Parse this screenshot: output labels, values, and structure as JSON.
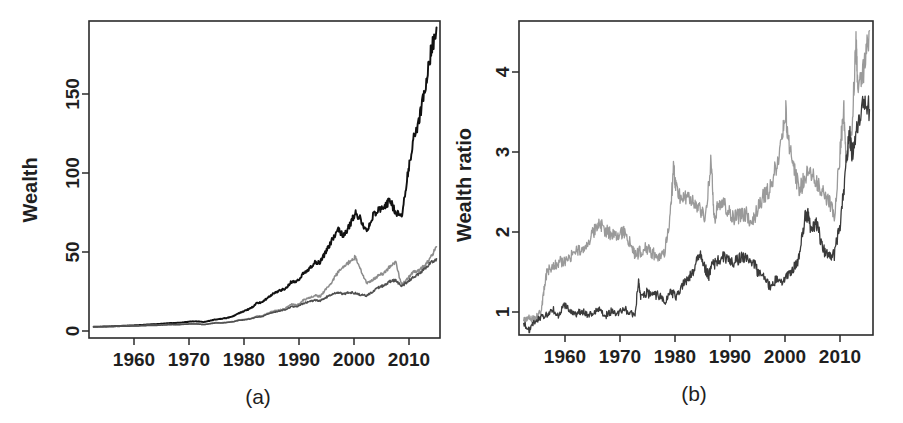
{
  "figure": {
    "background": "#ffffff",
    "panels": [
      {
        "id": "a",
        "caption": "(a)",
        "ylabel": "Wealth",
        "xlabel": "",
        "y_ticks": [
          0,
          50,
          100,
          150
        ],
        "x_ticks": [
          1960,
          1970,
          1980,
          1990,
          2000,
          2010
        ]
      },
      {
        "id": "b",
        "caption": "(b)",
        "ylabel": "Wealth ratio",
        "xlabel": "",
        "y_ticks": [
          1,
          2,
          3,
          4
        ],
        "x_ticks": [
          1960,
          1970,
          1980,
          1990,
          2000,
          2010
        ]
      }
    ]
  },
  "chart_data": [
    {
      "type": "line",
      "title": "",
      "caption": "(a)",
      "xlabel": "",
      "ylabel": "Wealth",
      "xlim": [
        1954.2,
        2014.6
      ],
      "ylim": [
        -6,
        192
      ],
      "xticks": [
        1960,
        1970,
        1980,
        1990,
        2000,
        2010
      ],
      "yticks": [
        0,
        50,
        100,
        150
      ],
      "grid": false,
      "legend": "none",
      "series": [
        {
          "name": "strategy-black",
          "color": "#111111",
          "width": 1.9,
          "x": [
            1955,
            1956,
            1957,
            1958,
            1959,
            1960,
            1961,
            1962,
            1963,
            1964,
            1965,
            1966,
            1967,
            1968,
            1969,
            1970,
            1971,
            1972,
            1973,
            1974,
            1975,
            1976,
            1977,
            1978,
            1979,
            1980,
            1981,
            1982,
            1983,
            1984,
            1985,
            1986,
            1987,
            1988,
            1989,
            1990,
            1991,
            1992,
            1993,
            1994,
            1995,
            1996,
            1997,
            1998,
            1999,
            2000,
            2001,
            2002,
            2003,
            2004,
            2005,
            2006,
            2007,
            2008,
            2009,
            2010,
            2011,
            2012,
            2013,
            2014
          ],
          "values": [
            1.0,
            1.1,
            1.2,
            1.3,
            1.5,
            1.6,
            1.8,
            1.9,
            2.1,
            2.4,
            2.6,
            2.7,
            3.0,
            3.3,
            3.4,
            3.6,
            4.0,
            4.4,
            4.3,
            4.0,
            4.8,
            5.6,
            6.0,
            6.6,
            7.6,
            9.5,
            11.0,
            12.5,
            15.5,
            16.5,
            19.0,
            22.0,
            23.5,
            25.0,
            29.0,
            29.5,
            34.0,
            37.0,
            41.0,
            41.5,
            48.0,
            55.0,
            62.0,
            58.0,
            64.0,
            72.0,
            68.0,
            60.0,
            70.0,
            74.0,
            76.0,
            80.0,
            72.0,
            70.0,
            95.0,
            118.0,
            130.0,
            150.0,
            172.0,
            188.0
          ]
        },
        {
          "name": "strategy-midgray",
          "color": "#8c8c8c",
          "width": 1.5,
          "x": [
            1955,
            1956,
            1957,
            1958,
            1959,
            1960,
            1961,
            1962,
            1963,
            1964,
            1965,
            1966,
            1967,
            1968,
            1969,
            1970,
            1971,
            1972,
            1973,
            1974,
            1975,
            1976,
            1977,
            1978,
            1979,
            1980,
            1981,
            1982,
            1983,
            1984,
            1985,
            1986,
            1987,
            1988,
            1989,
            1990,
            1991,
            1992,
            1993,
            1994,
            1995,
            1996,
            1997,
            1998,
            1999,
            2000,
            2001,
            2002,
            2003,
            2004,
            2005,
            2006,
            2007,
            2008,
            2009,
            2010,
            2011,
            2012,
            2013,
            2014
          ],
          "values": [
            1.0,
            1.05,
            1.1,
            1.2,
            1.3,
            1.35,
            1.5,
            1.5,
            1.7,
            1.9,
            2.0,
            2.0,
            2.3,
            2.5,
            2.4,
            2.5,
            2.8,
            3.0,
            2.8,
            2.4,
            3.0,
            3.6,
            3.5,
            3.8,
            4.3,
            5.3,
            5.6,
            6.2,
            7.6,
            7.8,
            9.6,
            11.0,
            11.5,
            12.5,
            15.0,
            14.5,
            17.5,
            19.0,
            20.5,
            20.0,
            25.0,
            29.0,
            35.0,
            38.0,
            41.5,
            44.5,
            36.0,
            28.0,
            30.5,
            33.0,
            34.5,
            39.0,
            41.5,
            27.0,
            31.0,
            35.0,
            36.0,
            39.5,
            44.0,
            51.0
          ]
        },
        {
          "name": "strategy-darkgray",
          "color": "#4f4f4f",
          "width": 1.5,
          "x": [
            1955,
            1956,
            1957,
            1958,
            1959,
            1960,
            1961,
            1962,
            1963,
            1964,
            1965,
            1966,
            1967,
            1968,
            1969,
            1970,
            1971,
            1972,
            1973,
            1974,
            1975,
            1976,
            1977,
            1978,
            1979,
            1980,
            1981,
            1982,
            1983,
            1984,
            1985,
            1986,
            1987,
            1988,
            1989,
            1990,
            1991,
            1992,
            1993,
            1994,
            1995,
            1996,
            1997,
            1998,
            1999,
            2000,
            2001,
            2002,
            2003,
            2004,
            2005,
            2006,
            2007,
            2008,
            2009,
            2010,
            2011,
            2012,
            2013,
            2014
          ],
          "values": [
            1.0,
            1.05,
            1.1,
            1.15,
            1.25,
            1.3,
            1.4,
            1.45,
            1.6,
            1.75,
            1.85,
            1.9,
            2.1,
            2.3,
            2.3,
            2.4,
            2.6,
            2.8,
            2.7,
            2.4,
            2.9,
            3.4,
            3.4,
            3.7,
            4.1,
            5.0,
            5.3,
            5.9,
            7.1,
            7.4,
            9.0,
            10.2,
            10.8,
            11.6,
            13.6,
            13.5,
            15.5,
            16.6,
            17.6,
            17.4,
            19.5,
            21.0,
            22.5,
            21.5,
            22.5,
            22.0,
            21.0,
            20.5,
            23.0,
            25.5,
            27.0,
            29.5,
            30.0,
            26.5,
            29.0,
            32.0,
            34.0,
            37.0,
            41.0,
            43.5
          ]
        }
      ]
    },
    {
      "type": "line",
      "title": "",
      "caption": "(b)",
      "xlabel": "",
      "ylabel": "Wealth ratio",
      "xlim": [
        1954.2,
        2014.6
      ],
      "ylim": [
        0.82,
        4.72
      ],
      "xticks": [
        1960,
        1970,
        1980,
        1990,
        2000,
        2010
      ],
      "yticks": [
        1,
        2,
        3,
        4
      ],
      "grid": false,
      "legend": "none",
      "series": [
        {
          "name": "ratio-light",
          "color": "#9a9a9a",
          "width": 1.3,
          "x": [
            1955,
            1956,
            1957,
            1958,
            1958.5,
            1959,
            1960,
            1961,
            1962,
            1963,
            1964,
            1965,
            1966,
            1967,
            1968,
            1969,
            1970,
            1971,
            1972,
            1973,
            1974,
            1975,
            1976,
            1977,
            1978,
            1979,
            1980,
            1980.6,
            1981,
            1982,
            1983,
            1984,
            1985,
            1986,
            1987,
            1987.5,
            1988,
            1989,
            1990,
            1991,
            1992,
            1993,
            1994,
            1995,
            1996,
            1997,
            1998,
            1999,
            1999.7,
            2000,
            2001,
            2002,
            2003,
            2004,
            2005,
            2006,
            2007,
            2008,
            2009,
            2009.6,
            2010,
            2011,
            2011.7,
            2012,
            2013,
            2014
          ],
          "values": [
            1.0,
            1.03,
            1.02,
            1.12,
            1.4,
            1.62,
            1.68,
            1.72,
            1.74,
            1.8,
            1.86,
            1.88,
            1.95,
            2.12,
            2.2,
            2.12,
            2.06,
            2.04,
            2.1,
            1.98,
            1.82,
            1.86,
            1.9,
            1.84,
            1.78,
            1.82,
            2.3,
            2.92,
            2.62,
            2.52,
            2.5,
            2.46,
            2.38,
            2.3,
            3.0,
            2.25,
            2.4,
            2.5,
            2.34,
            2.28,
            2.3,
            2.32,
            2.2,
            2.42,
            2.56,
            2.62,
            2.9,
            3.2,
            3.62,
            3.3,
            2.96,
            2.6,
            2.78,
            2.84,
            2.7,
            2.6,
            2.5,
            2.3,
            3.1,
            3.66,
            3.0,
            3.35,
            4.45,
            3.9,
            4.1,
            4.6
          ]
        },
        {
          "name": "ratio-dark",
          "color": "#3a3a3a",
          "width": 1.3,
          "x": [
            1955,
            1956,
            1957,
            1958,
            1959,
            1960,
            1961,
            1962,
            1963,
            1964,
            1965,
            1966,
            1967,
            1968,
            1969,
            1970,
            1971,
            1972,
            1973,
            1974,
            1974.6,
            1975,
            1976,
            1977,
            1978,
            1979,
            1980,
            1981,
            1982,
            1983,
            1984,
            1985,
            1986,
            1986.6,
            1987,
            1988,
            1989,
            1990,
            1991,
            1992,
            1993,
            1994,
            1995,
            1996,
            1997,
            1998,
            1999,
            2000,
            2001,
            2002,
            2003,
            2003.6,
            2004,
            2005,
            2006,
            2007,
            2008,
            2009,
            2010,
            2010.6,
            2011,
            2012,
            2013,
            2014
          ],
          "values": [
            0.96,
            0.88,
            1.0,
            1.05,
            1.07,
            1.14,
            1.06,
            1.2,
            1.1,
            1.08,
            1.12,
            1.06,
            1.1,
            1.13,
            1.06,
            1.12,
            1.07,
            1.16,
            1.1,
            1.08,
            1.5,
            1.28,
            1.35,
            1.3,
            1.32,
            1.22,
            1.36,
            1.3,
            1.44,
            1.5,
            1.62,
            1.86,
            1.64,
            1.56,
            1.66,
            1.74,
            1.8,
            1.76,
            1.72,
            1.78,
            1.8,
            1.74,
            1.6,
            1.52,
            1.42,
            1.5,
            1.46,
            1.54,
            1.66,
            1.78,
            2.28,
            2.34,
            2.1,
            2.2,
            1.9,
            1.78,
            1.82,
            2.2,
            2.9,
            3.35,
            3.05,
            3.45,
            3.75,
            3.62
          ]
        }
      ]
    }
  ]
}
